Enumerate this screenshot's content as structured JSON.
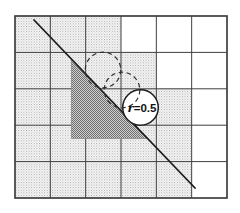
{
  "diagram": {
    "grid": {
      "x": 15,
      "y": 16,
      "width": 212,
      "height": 182,
      "columns": 6,
      "rows": 5,
      "shaded_columns_by_row": [
        [
          1,
          2,
          3
        ],
        [
          1,
          2,
          3,
          4
        ],
        [
          1,
          2,
          3,
          4,
          5
        ],
        [
          1,
          2,
          3,
          4,
          5
        ],
        [
          1,
          2,
          3,
          4,
          5
        ]
      ]
    },
    "line": {
      "x1": 34,
      "y1": 20,
      "x2": 195,
      "y2": 188
    },
    "triangle": {
      "points": [
        [
          71.5,
          59.5
        ],
        [
          71.5,
          138.5
        ],
        [
          147,
          138.5
        ]
      ]
    },
    "circles": {
      "radius": 17.8,
      "dashed": [
        [
          103,
          70
        ],
        [
          122,
          90
        ]
      ],
      "solid": [
        140.5,
        107.5
      ],
      "label": {
        "text": "r=0.5",
        "italic_part": "r",
        "rest": "=0.5"
      },
      "label_x": 142,
      "label_y": 111.5
    },
    "colors": {
      "background": "#ffffff",
      "grid_line": "#3f3f3f",
      "cell_white": "#ffffff",
      "stipple_bg": "#fdfdfd",
      "stipple_dot_dark": "#a0a0a0",
      "stipple_dot_light": "#c2c2c2",
      "halftone_bg": "#d0d0d0",
      "halftone_dot": "#6e6e6e",
      "triangle_edge": "#8a8a8a",
      "line": "#1c1c1c",
      "dashed_circle": "#2e2e2e",
      "solid_circle_fill": "#ffffff",
      "solid_circle_stroke": "#1c1c1c",
      "label": "#111111"
    }
  }
}
